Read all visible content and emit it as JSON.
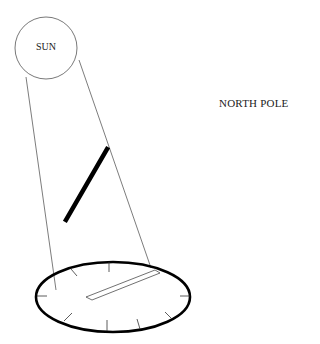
{
  "diagram": {
    "sun": {
      "label": "SUN",
      "cx": 46,
      "cy": 48,
      "r": 31
    },
    "location_label": "NORTH POLE",
    "rays": [
      {
        "x1": 26,
        "y1": 77,
        "x2": 56,
        "y2": 290
      },
      {
        "x1": 79,
        "y1": 60,
        "x2": 151,
        "y2": 268
      }
    ],
    "gnomon": {
      "x1": 107,
      "y1": 148,
      "x2": 66,
      "y2": 221
    },
    "dial": {
      "cx": 113,
      "cy": 297,
      "rx": 77,
      "ry": 35
    },
    "shadow": {
      "points": "86,297 155,270 160,273 92,300"
    },
    "colors": {
      "stroke": "#000000",
      "thin": "#444444"
    }
  }
}
